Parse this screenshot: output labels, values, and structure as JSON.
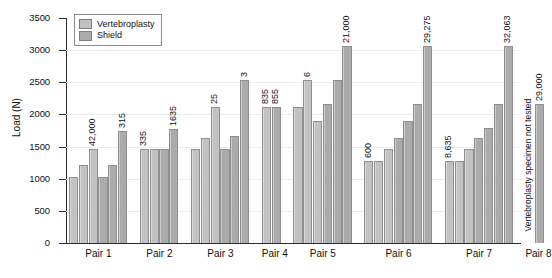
{
  "chart_data": {
    "type": "bar",
    "title": "",
    "xlabel": "",
    "ylabel": "Load (N)",
    "ylim": [
      0,
      3500
    ],
    "ytick_step": 500,
    "yticks": [
      "3500",
      "3000",
      "2500",
      "2000",
      "1500",
      "1000",
      "500",
      "0"
    ],
    "grid": true,
    "legend_position": "top-left",
    "legend": [
      {
        "name": "Vertebroplasty",
        "color": "#c2c2c2"
      },
      {
        "name": "Shield",
        "color": "#ababab"
      }
    ],
    "categories": [
      "Pair 1",
      "Pair 2",
      "Pair 3",
      "Pair 4",
      "Pair 5",
      "Pair 6",
      "Pair 7",
      "Pair 8"
    ],
    "groups": [
      {
        "category": "Pair 1",
        "bars": [
          {
            "series": "Vertebroplasty",
            "value": 1020,
            "label": ""
          },
          {
            "series": "Vertebroplasty",
            "value": 1220,
            "label": ""
          },
          {
            "series": "Vertebroplasty",
            "value": 1470,
            "label": "42,000"
          },
          {
            "series": "Shield",
            "value": 1030,
            "label": ""
          },
          {
            "series": "Shield",
            "value": 1220,
            "label": ""
          },
          {
            "series": "Shield",
            "value": 1745,
            "label": "315"
          }
        ]
      },
      {
        "category": "Pair 2",
        "bars": [
          {
            "series": "Vertebroplasty",
            "value": 1470,
            "label": "335"
          },
          {
            "series": "Vertebroplasty",
            "value": 1470,
            "label": ""
          },
          {
            "series": "Shield",
            "value": 1470,
            "label": ""
          },
          {
            "series": "Shield",
            "value": 1775,
            "label": "1635"
          }
        ]
      },
      {
        "category": "Pair 3",
        "bars": [
          {
            "series": "Vertebroplasty",
            "value": 1470,
            "label": ""
          },
          {
            "series": "Vertebroplasty",
            "value": 1640,
            "label": ""
          },
          {
            "series": "Vertebroplasty",
            "value": 2110,
            "label": "25"
          },
          {
            "series": "Shield",
            "value": 1470,
            "label": ""
          },
          {
            "series": "Shield",
            "value": 1665,
            "label": ""
          },
          {
            "series": "Shield",
            "value": 2530,
            "label": "3"
          }
        ]
      },
      {
        "category": "Pair 4",
        "bars": [
          {
            "series": "Vertebroplasty",
            "value": 2110,
            "label": "835"
          },
          {
            "series": "Shield",
            "value": 2110,
            "label": "855"
          }
        ]
      },
      {
        "category": "Pair 5",
        "bars": [
          {
            "series": "Vertebroplasty",
            "value": 2110,
            "label": ""
          },
          {
            "series": "Vertebroplasty",
            "value": 2530,
            "label": "6"
          },
          {
            "series": "Vertebroplasty",
            "value": 1900,
            "label": ""
          },
          {
            "series": "Shield",
            "value": 2170,
            "label": ""
          },
          {
            "series": "Shield",
            "value": 2540,
            "label": ""
          },
          {
            "series": "Shield",
            "value": 3060,
            "label": "21,000"
          }
        ]
      },
      {
        "category": "Pair 6",
        "bars": [
          {
            "series": "Vertebroplasty",
            "value": 1270,
            "label": "600"
          },
          {
            "series": "Vertebroplasty",
            "value": 1270,
            "label": ""
          },
          {
            "series": "Vertebroplasty",
            "value": 1470,
            "label": ""
          },
          {
            "series": "Shield",
            "value": 1640,
            "label": ""
          },
          {
            "series": "Shield",
            "value": 1900,
            "label": ""
          },
          {
            "series": "Shield",
            "value": 2170,
            "label": ""
          },
          {
            "series": "Shield",
            "value": 3060,
            "label": "29,275"
          }
        ]
      },
      {
        "category": "Pair 7",
        "bars": [
          {
            "series": "Vertebroplasty",
            "value": 1270,
            "label": "8,635"
          },
          {
            "series": "Vertebroplasty",
            "value": 1270,
            "label": ""
          },
          {
            "series": "Vertebroplasty",
            "value": 1470,
            "label": ""
          },
          {
            "series": "Shield",
            "value": 1640,
            "label": ""
          },
          {
            "series": "Shield",
            "value": 1790,
            "label": ""
          },
          {
            "series": "Shield",
            "value": 2170,
            "label": ""
          },
          {
            "series": "Shield",
            "value": 3060,
            "label": "32,063"
          }
        ]
      },
      {
        "category": "Pair 8",
        "bars": [
          {
            "series": "Shield",
            "value": 2170,
            "label": "29,000"
          }
        ],
        "note": "Vertebroplasty specimen not tested"
      }
    ]
  }
}
